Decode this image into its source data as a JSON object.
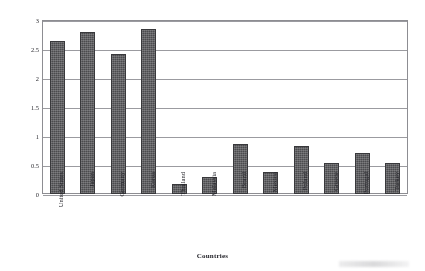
{
  "chart_data": {
    "type": "bar",
    "title": "",
    "xlabel": "Countries",
    "ylabel": "R & D expenditures as a % of GNP",
    "categories": [
      "United States",
      "Japan",
      "Germany",
      "Korea",
      "Thailand",
      "Malaysia",
      "Brazil",
      "Mexico",
      "Poland",
      "Greece",
      "Portugal",
      "Turkey"
    ],
    "values": [
      2.63,
      2.8,
      2.42,
      2.85,
      0.17,
      0.29,
      0.86,
      0.38,
      0.83,
      0.54,
      0.7,
      0.53
    ],
    "ylim": [
      0,
      3
    ],
    "yticks": [
      "0",
      "0.5",
      "1",
      "1.5",
      "2",
      "2.5",
      "3"
    ],
    "ytick_values": [
      0,
      0.5,
      1,
      1.5,
      2,
      2.5,
      3
    ],
    "grid": true,
    "legend": false,
    "bar_color": "#4c4c4f",
    "gridline_color": "#9a9a9f",
    "axis_color": "#8d8d92",
    "background": "#ffffff"
  }
}
